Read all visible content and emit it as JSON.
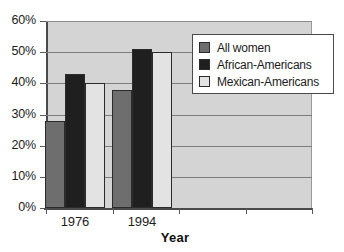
{
  "chart_data": {
    "type": "bar",
    "title": "",
    "subtitle": "",
    "xlabel": "Year",
    "ylabel": "",
    "categories": [
      "1976",
      "1994",
      "",
      ""
    ],
    "series": [
      {
        "name": "All women",
        "color": "#6e6e6e",
        "values": [
          28,
          38,
          null,
          null
        ]
      },
      {
        "name": "African-Americans",
        "color": "#201f1f",
        "values": [
          43,
          51,
          null,
          null
        ]
      },
      {
        "name": "Mexican-Americans",
        "color": "#e3e3e3",
        "values": [
          40,
          50,
          null,
          null
        ]
      }
    ],
    "ylim": [
      0,
      60
    ],
    "ytick_values": [
      0,
      10,
      20,
      30,
      40,
      50,
      60
    ],
    "ytick_labels": [
      "0%",
      "10%",
      "20%",
      "30%",
      "40%",
      "50%",
      "60%"
    ],
    "xtick_labels": [
      "1976",
      "1994"
    ],
    "grid": true,
    "grid_axis": "y",
    "legend_position": "upper right",
    "plot_background": "#d4d4d4",
    "grid_color": "#7d7d7d",
    "axis_color": "#4a4a4a"
  },
  "axis": {
    "x_title": "Year"
  },
  "legend": {
    "entries": [
      {
        "label": "All women"
      },
      {
        "label": "African-Americans"
      },
      {
        "label": "Mexican-Americans"
      }
    ]
  }
}
